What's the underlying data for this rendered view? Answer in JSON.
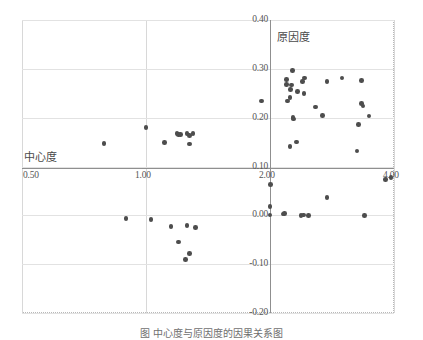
{
  "figure": {
    "caption": "图    中心度与原因度的因果关系图"
  },
  "chart_data": {
    "type": "scatter",
    "title": "",
    "xlabel": "中心度",
    "ylabel": "原因度",
    "xlim": [
      0.5,
      4.0
    ],
    "ylim": [
      -0.2,
      0.4
    ],
    "xticks": [
      "0.50",
      "1.00",
      "2.00",
      "4.00"
    ],
    "xtick_values": [
      0.5,
      1.0,
      2.0,
      4.0
    ],
    "yticks": [
      "0.40",
      "0.30",
      "0.20",
      "0.10",
      "0.00",
      "-0.10",
      "-0.20"
    ],
    "ytick_values": [
      0.4,
      0.3,
      0.2,
      0.1,
      0.0,
      -0.1,
      -0.2
    ],
    "grid": true,
    "legend": "none",
    "axis_origin": {
      "x": 2.0,
      "y": 0.1
    },
    "marker": {
      "shape": "circle",
      "color": "#4d4d4d",
      "size": 4.6
    },
    "points": [
      {
        "x": 0.83,
        "y": 0.147
      },
      {
        "x": 1.0,
        "y": 0.18
      },
      {
        "x": 1.15,
        "y": 0.149
      },
      {
        "x": 1.25,
        "y": 0.168
      },
      {
        "x": 1.26,
        "y": 0.166
      },
      {
        "x": 1.28,
        "y": 0.165
      },
      {
        "x": 1.33,
        "y": 0.167
      },
      {
        "x": 1.35,
        "y": 0.163
      },
      {
        "x": 1.38,
        "y": 0.168
      },
      {
        "x": 1.35,
        "y": 0.146
      },
      {
        "x": 1.93,
        "y": 0.234
      },
      {
        "x": 2.28,
        "y": 0.234
      },
      {
        "x": 2.27,
        "y": 0.278
      },
      {
        "x": 2.27,
        "y": 0.268
      },
      {
        "x": 2.36,
        "y": 0.296
      },
      {
        "x": 2.33,
        "y": 0.258
      },
      {
        "x": 2.35,
        "y": 0.267
      },
      {
        "x": 2.32,
        "y": 0.241
      },
      {
        "x": 2.37,
        "y": 0.2
      },
      {
        "x": 2.38,
        "y": 0.197
      },
      {
        "x": 2.44,
        "y": 0.254
      },
      {
        "x": 2.52,
        "y": 0.274
      },
      {
        "x": 2.56,
        "y": 0.281
      },
      {
        "x": 2.55,
        "y": 0.25
      },
      {
        "x": 2.32,
        "y": 0.141
      },
      {
        "x": 2.43,
        "y": 0.15
      },
      {
        "x": 2.73,
        "y": 0.222
      },
      {
        "x": 2.85,
        "y": 0.205
      },
      {
        "x": 2.92,
        "y": 0.274
      },
      {
        "x": 3.16,
        "y": 0.281
      },
      {
        "x": 3.48,
        "y": 0.276
      },
      {
        "x": 3.43,
        "y": 0.186
      },
      {
        "x": 3.48,
        "y": 0.229
      },
      {
        "x": 3.5,
        "y": 0.224
      },
      {
        "x": 3.6,
        "y": 0.203
      },
      {
        "x": 3.4,
        "y": 0.132
      },
      {
        "x": 2.01,
        "y": 0.063
      },
      {
        "x": 2.0,
        "y": 0.018
      },
      {
        "x": 2.0,
        "y": 0.001
      },
      {
        "x": 0.92,
        "y": -0.007
      },
      {
        "x": 1.04,
        "y": -0.009
      },
      {
        "x": 1.2,
        "y": -0.023
      },
      {
        "x": 1.33,
        "y": -0.021
      },
      {
        "x": 1.4,
        "y": -0.025
      },
      {
        "x": 1.26,
        "y": -0.055
      },
      {
        "x": 1.35,
        "y": -0.078
      },
      {
        "x": 1.32,
        "y": -0.09
      },
      {
        "x": 2.21,
        "y": 0.003
      },
      {
        "x": 2.23,
        "y": 0.004
      },
      {
        "x": 2.5,
        "y": 0.0
      },
      {
        "x": 2.54,
        "y": 0.001
      },
      {
        "x": 2.62,
        "y": 0.0
      },
      {
        "x": 2.92,
        "y": 0.037
      },
      {
        "x": 3.52,
        "y": 0.0
      },
      {
        "x": 3.86,
        "y": 0.073
      },
      {
        "x": 3.95,
        "y": 0.078
      }
    ]
  }
}
